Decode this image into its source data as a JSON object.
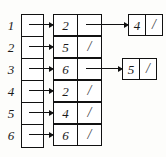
{
  "diagram": {
    "null_symbol": "/",
    "colors": {
      "stroke": "#111111",
      "background": "#ffffff",
      "text": "#1a1a1a"
    },
    "index_labels": [
      "1",
      "2",
      "3",
      "4",
      "5",
      "6"
    ],
    "rows": [
      {
        "index": "1",
        "nodes": [
          {
            "value": "2",
            "next": "pointer"
          },
          {
            "value": "4",
            "next": "/"
          }
        ]
      },
      {
        "index": "2",
        "nodes": [
          {
            "value": "5",
            "next": "/"
          }
        ]
      },
      {
        "index": "3",
        "nodes": [
          {
            "value": "6",
            "next": "pointer"
          },
          {
            "value": "5",
            "next": "/"
          }
        ]
      },
      {
        "index": "4",
        "nodes": [
          {
            "value": "2",
            "next": "/"
          }
        ]
      },
      {
        "index": "5",
        "nodes": [
          {
            "value": "4",
            "next": "/"
          }
        ]
      },
      {
        "index": "6",
        "nodes": [
          {
            "value": "6",
            "next": "/"
          }
        ]
      }
    ]
  }
}
